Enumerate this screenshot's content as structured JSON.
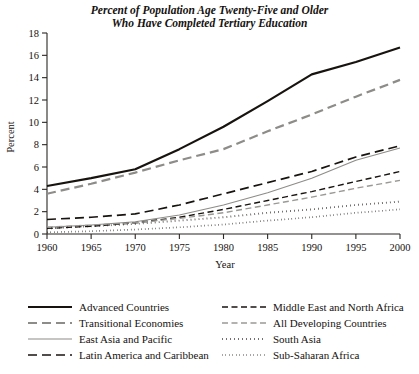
{
  "chart_data": {
    "type": "line",
    "title": "Percent of Population Age Twenty-Five and Older Who Have Completed Tertiary Education",
    "title_lines": [
      "Percent of Population Age Twenty-Five and Older",
      "Who Have Completed Tertiary Education"
    ],
    "xlabel": "Year",
    "ylabel": "Percent",
    "x": [
      1960,
      1965,
      1970,
      1975,
      1980,
      1985,
      1990,
      1995,
      2000
    ],
    "xlim": [
      1960,
      2000
    ],
    "ylim": [
      0,
      18
    ],
    "xticks": [
      1960,
      1965,
      1970,
      1975,
      1980,
      1985,
      1990,
      1995,
      2000
    ],
    "yticks": [
      0,
      2,
      4,
      6,
      8,
      10,
      12,
      14,
      16,
      18
    ],
    "xtick_labels": [
      "1960",
      "1965",
      "1970",
      "1975",
      "1980",
      "1985",
      "1990",
      "1995",
      "2000"
    ],
    "ytick_labels": [
      "0",
      "2",
      "4",
      "6",
      "8",
      "10",
      "12",
      "14",
      "16",
      "18"
    ],
    "grid": false,
    "legend_position": "below-plot",
    "legend_columns": 2,
    "series": [
      {
        "name": "Advanced Countries",
        "values": [
          4.3,
          5.0,
          5.8,
          7.6,
          9.6,
          11.9,
          14.3,
          15.4,
          16.7
        ],
        "color": "#17130f",
        "width": 2.2,
        "dash": "none",
        "legend_column": 0,
        "legend_row": 0
      },
      {
        "name": "Transitional Economies",
        "values": [
          3.6,
          4.5,
          5.5,
          6.6,
          7.6,
          9.2,
          10.7,
          12.3,
          13.8
        ],
        "color": "#8e8c89",
        "width": 2.2,
        "dash": "9,5",
        "legend_column": 0,
        "legend_row": 1
      },
      {
        "name": "East Asia and Pacific",
        "values": [
          0.6,
          0.8,
          1.1,
          1.7,
          2.6,
          3.7,
          5.0,
          6.6,
          7.7
        ],
        "color": "#8e8c89",
        "width": 1.1,
        "dash": "none",
        "legend_column": 0,
        "legend_row": 2
      },
      {
        "name": "Latin America and Caribbean",
        "values": [
          1.3,
          1.5,
          1.8,
          2.6,
          3.6,
          4.6,
          5.6,
          6.9,
          7.9
        ],
        "color": "#17130f",
        "width": 1.7,
        "dash": "9,5",
        "legend_column": 0,
        "legend_row": 3
      },
      {
        "name": "Middle East and North Africa",
        "values": [
          0.5,
          0.7,
          1.0,
          1.5,
          2.2,
          3.0,
          3.8,
          4.7,
          5.6
        ],
        "color": "#17130f",
        "width": 1.4,
        "dash": "6,3.5",
        "legend_column": 1,
        "legend_row": 0
      },
      {
        "name": "All Developing Countries",
        "values": [
          0.6,
          0.8,
          1.0,
          1.4,
          1.9,
          2.6,
          3.3,
          4.1,
          4.8
        ],
        "color": "#9b9996",
        "width": 1.4,
        "dash": "6,3.5",
        "legend_column": 1,
        "legend_row": 1
      },
      {
        "name": "South Asia",
        "values": [
          0.5,
          0.7,
          0.9,
          1.2,
          1.5,
          1.9,
          2.2,
          2.6,
          2.9
        ],
        "color": "#17130f",
        "width": 1.9,
        "dash": "0.6,3.4",
        "legend_column": 1,
        "legend_row": 2
      },
      {
        "name": "Sub-Saharan Africa",
        "values": [
          0.15,
          0.25,
          0.4,
          0.6,
          0.85,
          1.2,
          1.5,
          1.9,
          2.2
        ],
        "color": "#17130f",
        "width": 1.7,
        "dash": "0.5,3.0",
        "legend_column": 1,
        "legend_row": 3
      }
    ]
  }
}
